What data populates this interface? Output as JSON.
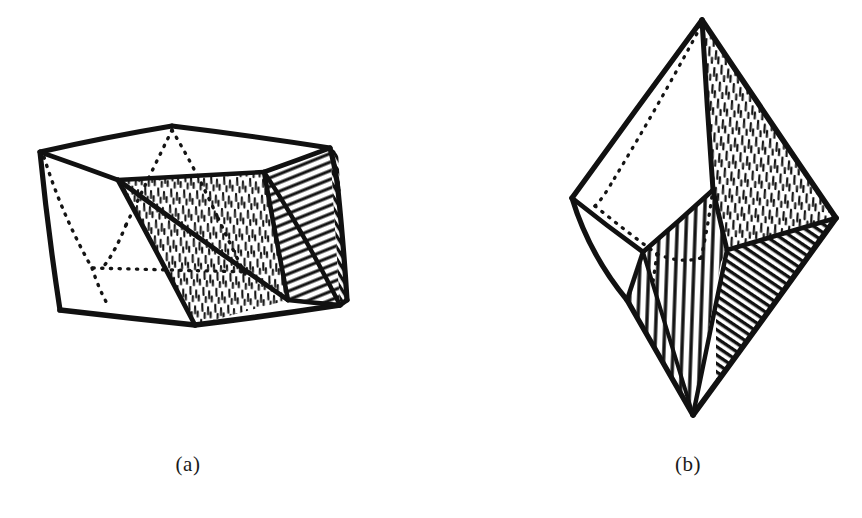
{
  "document": {
    "type": "line-drawing-figure",
    "background_color": "#ffffff",
    "ink_color": "#111111",
    "width": 862,
    "height": 518,
    "description": "Hand-drawn ink illustration of two crystal polyhedra"
  },
  "figures": [
    {
      "id": "a",
      "caption": "(a)",
      "name": "hexagonal-drum-polyhedron",
      "shading": [
        "short-dash-stipple",
        "diagonal-hatch",
        "solid-black"
      ],
      "hidden_edges": "dotted"
    },
    {
      "id": "b",
      "caption": "(b)",
      "name": "hexagonal-bipyramid-polyhedron",
      "shading": [
        "short-dash-stipple",
        "vertical-line-hatch",
        "diagonal-hatch",
        "solid-black"
      ],
      "hidden_edges": "dotted"
    }
  ]
}
